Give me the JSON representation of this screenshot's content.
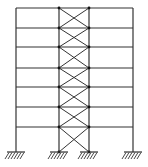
{
  "diagram": {
    "title": "",
    "type": "braced-frame-elevation",
    "stories": 7,
    "bays": 3,
    "braced_bay": 2,
    "colors": {
      "line": "#333333",
      "joint": "#111111",
      "background": "#ffffff"
    },
    "columns_x": [
      16,
      59,
      89,
      133
    ],
    "floors_y": [
      8,
      28,
      47,
      68,
      87,
      107,
      127
    ],
    "ground_y": 152,
    "supports": [
      "fixed",
      "fixed",
      "fixed",
      "fixed"
    ]
  }
}
